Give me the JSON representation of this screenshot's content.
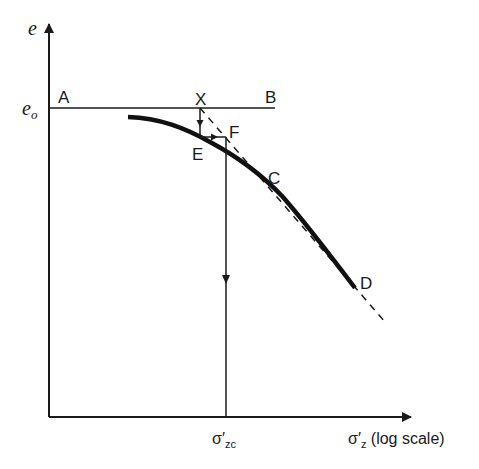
{
  "diagram": {
    "type": "consolidation-curve-casagrande-construction",
    "colors": {
      "ink": "#1a1a1a",
      "background": "#ffffff"
    },
    "axes": {
      "y_label": "e",
      "y_marker_label": "e",
      "y_marker_sub": "o",
      "x_label_prefix": "σ′",
      "x_label_sub": "z",
      "x_label_suffix": " (log scale)",
      "x_marker_prefix": "σ′",
      "x_marker_sub": "zc"
    },
    "points": {
      "A": "A",
      "B": "B",
      "X": "X",
      "E": "E",
      "F": "F",
      "C": "C",
      "D": "D"
    },
    "geometry": {
      "origin": [
        49,
        417
      ],
      "y_axis_top": [
        49,
        22
      ],
      "x_axis_end": [
        413,
        417
      ],
      "eo_line": {
        "from": [
          49,
          108
        ],
        "to": [
          275,
          108
        ]
      },
      "X": [
        200,
        108
      ],
      "E": [
        200,
        137
      ],
      "F": [
        226,
        137
      ],
      "C": [
        265,
        178
      ],
      "D": [
        355,
        288
      ],
      "curve_start": [
        128,
        117
      ],
      "dashed_end": [
        385,
        322
      ],
      "sigma_zc_x": 226
    }
  }
}
